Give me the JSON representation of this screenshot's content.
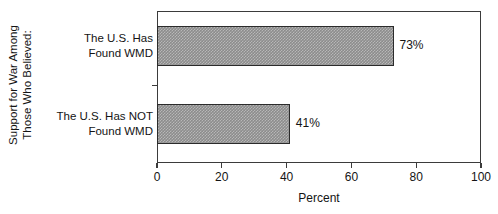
{
  "chart_data": {
    "type": "bar",
    "orientation": "horizontal",
    "title": "",
    "xlabel": "Percent",
    "ylabel": "Support for War Among Those Who Believed:",
    "ylabel_lines": [
      "Support for War Among",
      "Those Who Believed:"
    ],
    "categories": [
      "The U.S. Has Found WMD",
      "The U.S. Has NOT Found WMD"
    ],
    "category_lines": [
      [
        "The U.S. Has",
        "Found WMD"
      ],
      [
        "The U.S. Has NOT",
        "Found WMD"
      ]
    ],
    "values": [
      73,
      41
    ],
    "value_labels": [
      "73%",
      "41%"
    ],
    "xlim": [
      0,
      100
    ],
    "xticks": [
      0,
      20,
      40,
      60,
      80,
      100
    ],
    "xtick_labels": [
      "0",
      "20",
      "40",
      "60",
      "80",
      "100"
    ],
    "grid": false,
    "legend": false,
    "bar_fill_color": "#8c8c8c",
    "bar_edge_color": "#2b2b2b",
    "axis_color": "#3b3b3b",
    "background_color": "#ffffff",
    "text_color": "#141414"
  }
}
